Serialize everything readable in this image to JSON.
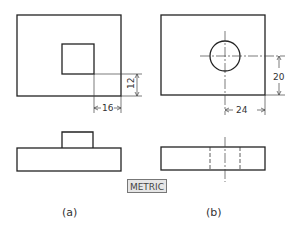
{
  "figure": {
    "label_units": "METRIC",
    "views": [
      {
        "caption": "(a)",
        "dim_vertical": "12",
        "dim_horizontal": "16",
        "feature": "square-boss"
      },
      {
        "caption": "(b)",
        "dim_vertical": "20",
        "dim_horizontal": "24",
        "feature": "through-hole"
      }
    ]
  },
  "colors": {
    "line": "#222222",
    "background": "#ffffff"
  }
}
